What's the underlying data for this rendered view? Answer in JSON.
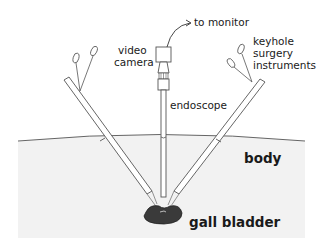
{
  "diagram": {
    "labels": {
      "to_monitor": "to monitor",
      "video_camera_line1": "video",
      "video_camera_line2": "camera",
      "keyhole_line1": "keyhole",
      "keyhole_line2": "surgery",
      "keyhole_line3": "instruments",
      "endoscope": "endoscope",
      "body": "body",
      "gall_bladder": "gall bladder"
    },
    "colors": {
      "background": "#ffffff",
      "body_fill": "#f2f2f2",
      "line": "#555555",
      "gall_bladder": "#3a3a3a",
      "text": "#1a1a1a"
    }
  }
}
